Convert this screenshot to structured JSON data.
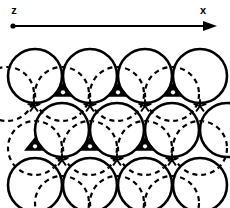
{
  "figure": {
    "background_color": "#ffffff",
    "stroke_color": "#000000",
    "width": 230,
    "height": 208
  },
  "axes": {
    "origin_label": "z",
    "direction_label": "x",
    "origin_label_x": 14,
    "origin_label_y": 14,
    "direction_label_x": 203,
    "direction_label_y": 14,
    "line": {
      "x1": 13,
      "y1": 26,
      "x2": 206,
      "y2": 26
    },
    "origin_dot": {
      "cx": 13,
      "cy": 26,
      "r": 2.6
    },
    "arrowhead": {
      "tip_x": 217,
      "tip_y": 26,
      "back_x": 203,
      "half_height": 5
    }
  },
  "lattice": {
    "circle_radius": 27,
    "circle_stroke_width": 2.6,
    "dashed_stroke_width": 2.2,
    "dash_pattern": "5,4",
    "rows": [
      {
        "name": "row-top",
        "cy": 76,
        "centers_x": [
          35,
          90,
          145,
          200
        ]
      },
      {
        "name": "row-middle",
        "cy": 130,
        "centers_x": [
          62,
          117,
          172,
          227
        ]
      },
      {
        "name": "row-bottom",
        "cy": 185,
        "centers_x": [
          35,
          90,
          145,
          200
        ]
      }
    ],
    "hidden_rows": [
      {
        "name": "hidden-row-top",
        "cy": 94,
        "centers_x": [
          62,
          117,
          172,
          7
        ]
      },
      {
        "name": "hidden-row-middle",
        "cy": 148,
        "centers_x": [
          35,
          90,
          145,
          200
        ]
      },
      {
        "name": "hidden-row-bottom",
        "cy": 203,
        "centers_x": [
          62,
          117,
          172
        ]
      }
    ],
    "octahedral_sites": [
      {
        "cx": 63,
        "cy": 91
      },
      {
        "cx": 118,
        "cy": 91
      },
      {
        "cx": 173,
        "cy": 91
      },
      {
        "cx": 90,
        "cy": 145
      },
      {
        "cx": 145,
        "cy": 145
      },
      {
        "cx": 35,
        "cy": 145
      }
    ],
    "tetrahedral_sites": [
      {
        "cx": 34,
        "cy": 106
      },
      {
        "cx": 90,
        "cy": 106
      },
      {
        "cx": 145,
        "cy": 106
      },
      {
        "cx": 200,
        "cy": 106
      },
      {
        "cx": 62,
        "cy": 160
      },
      {
        "cx": 117,
        "cy": 160
      },
      {
        "cx": 172,
        "cy": 160
      }
    ]
  },
  "markers": {
    "octahedral_name": "octahedral-site-marker",
    "tetrahedral_name": "tetrahedral-site-marker",
    "octahedral_triangle_half_width": 11,
    "octahedral_triangle_height": 13,
    "octahedral_dot_radius": 2.1,
    "tetrahedral_star_radius": 6
  }
}
